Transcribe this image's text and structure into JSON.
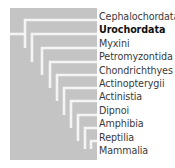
{
  "diagram": {
    "type": "cladogram",
    "background_color": "#c4c4c4",
    "line_color": "#f4f4f4",
    "taxa": [
      {
        "label": "Cephalochordata",
        "highlighted": false
      },
      {
        "label": "Urochordata",
        "highlighted": true
      },
      {
        "label": "Myxini",
        "highlighted": false
      },
      {
        "label": "Petromyzontida",
        "highlighted": false
      },
      {
        "label": "Chondrichthyes",
        "highlighted": false
      },
      {
        "label": "Actinopterygii",
        "highlighted": false
      },
      {
        "label": "Actinistia",
        "highlighted": false
      },
      {
        "label": "Dipnoi",
        "highlighted": false
      },
      {
        "label": "Amphibia",
        "highlighted": false
      },
      {
        "label": "Reptilia",
        "highlighted": false
      },
      {
        "label": "Mammalia",
        "highlighted": false
      }
    ]
  }
}
